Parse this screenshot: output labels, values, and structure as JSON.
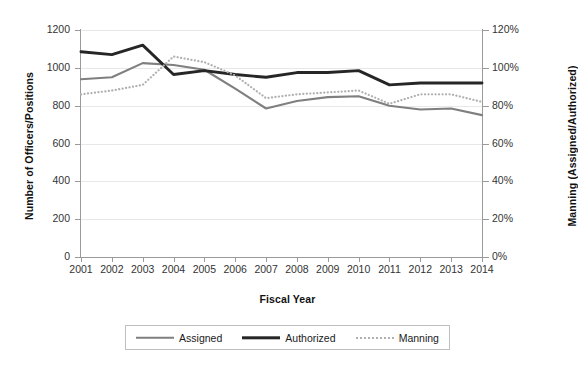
{
  "chart_data": {
    "type": "line",
    "title": "",
    "xlabel": "Fiscal Year",
    "ylabel": "Number of Officers/Positions",
    "y2label": "Manning (Assigned/Authorized)",
    "categories": [
      "2001",
      "2002",
      "2003",
      "2004",
      "2005",
      "2006",
      "2007",
      "2008",
      "2009",
      "2010",
      "2011",
      "2012",
      "2013",
      "2014"
    ],
    "ylim": [
      0,
      1200
    ],
    "yticks": [
      "0",
      "200",
      "400",
      "600",
      "800",
      "1000",
      "1200"
    ],
    "y2lim": [
      0,
      120
    ],
    "y2ticks": [
      "0%",
      "20%",
      "40%",
      "60%",
      "80%",
      "100%",
      "120%"
    ],
    "grid": true,
    "legend_position": "bottom",
    "series": [
      {
        "name": "Assigned",
        "axis": "left",
        "style": "solid",
        "color": "#7f7f7f",
        "values": [
          940,
          950,
          1025,
          1015,
          990,
          890,
          785,
          825,
          845,
          850,
          800,
          780,
          785,
          750
        ]
      },
      {
        "name": "Authorized",
        "axis": "left",
        "style": "solid",
        "color": "#262626",
        "values": [
          1085,
          1070,
          1120,
          965,
          985,
          965,
          950,
          975,
          975,
          985,
          910,
          920,
          920,
          920
        ]
      },
      {
        "name": "Manning",
        "axis": "right",
        "style": "dotted",
        "color": "#b0b0b0",
        "values": [
          86,
          88,
          91,
          106,
          103,
          96,
          84,
          86,
          87,
          88,
          81,
          86,
          86,
          82
        ]
      }
    ]
  },
  "legend": {
    "items": [
      {
        "label": "Assigned"
      },
      {
        "label": "Authorized"
      },
      {
        "label": "Manning"
      }
    ]
  }
}
